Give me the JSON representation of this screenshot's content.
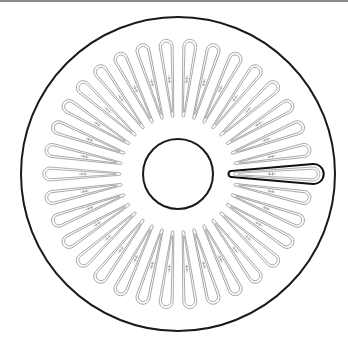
{
  "figure": {
    "title": "Disk with radial teardrop slots",
    "center": {
      "x": 178,
      "y": 174
    },
    "outer_ring": {
      "radius": 157,
      "stroke": "#1a1a1a",
      "stroke_width": 2
    },
    "hub": {
      "radius": 35,
      "stroke": "#1a1a1a",
      "stroke_width": 2
    },
    "slots": {
      "count": 34,
      "start_angle_deg": 0,
      "tip_radius": 58,
      "round_end_center_radius": 127,
      "round_end_radius": 7,
      "tip_half_width": 1.2,
      "outline_color": "#9a9a9a",
      "outline_width": 0.8,
      "inner_offset": 2.2,
      "mark_radius": 95,
      "mark_color": "#888888"
    },
    "highlighted_slot": {
      "index": 0,
      "tip_radius": 53,
      "round_end_center_radius": 134,
      "round_end_radius": 10,
      "tip_half_width": 3,
      "stroke": "#111111",
      "stroke_width": 2
    }
  }
}
